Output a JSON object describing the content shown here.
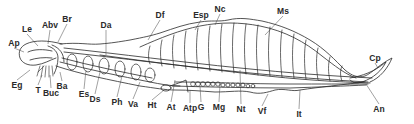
{
  "figure": {
    "line_color": "#2a2a2a",
    "background": "#ffffff",
    "labels": [
      {
        "id": "Ap",
        "text": "Ap",
        "x": 14,
        "y": 43,
        "tx": 24,
        "ty": 52
      },
      {
        "id": "Le",
        "text": "Le",
        "x": 27,
        "y": 29,
        "tx": 38,
        "ty": 46
      },
      {
        "id": "Abv",
        "text": "Abv",
        "x": 50,
        "y": 25,
        "tx": 48,
        "ty": 44
      },
      {
        "id": "Br",
        "text": "Br",
        "x": 67,
        "y": 19,
        "tx": 58,
        "ty": 42
      },
      {
        "id": "Da",
        "text": "Da",
        "x": 106,
        "y": 25,
        "tx": 106,
        "ty": 55
      },
      {
        "id": "Df",
        "text": "Df",
        "x": 160,
        "y": 15,
        "tx": 148,
        "ty": 40
      },
      {
        "id": "Esp",
        "text": "Esp",
        "x": 201,
        "y": 15,
        "tx": 195,
        "ty": 30
      },
      {
        "id": "Nc",
        "text": "Nc",
        "x": 220,
        "y": 9,
        "tx": 215,
        "ty": 25
      },
      {
        "id": "Ms",
        "text": "Ms",
        "x": 283,
        "y": 11,
        "tx": 265,
        "ty": 35
      },
      {
        "id": "Cp",
        "text": "Cp",
        "x": 375,
        "y": 58,
        "tx": 378,
        "ty": 68
      },
      {
        "id": "An",
        "text": "An",
        "x": 379,
        "y": 109,
        "tx": 366,
        "ty": 84
      },
      {
        "id": "Eg",
        "text": "Eg",
        "x": 17,
        "y": 85,
        "tx": 30,
        "ty": 70
      },
      {
        "id": "T",
        "text": "T",
        "x": 38,
        "y": 90,
        "tx": 42,
        "ty": 75
      },
      {
        "id": "Buc",
        "text": "Buc",
        "x": 51,
        "y": 93,
        "tx": 50,
        "ty": 75
      },
      {
        "id": "Ba",
        "text": "Ba",
        "x": 62,
        "y": 86,
        "tx": 60,
        "ty": 72
      },
      {
        "id": "Es",
        "text": "Es",
        "x": 84,
        "y": 94,
        "tx": 86,
        "ty": 70
      },
      {
        "id": "Ds",
        "text": "Ds",
        "x": 95,
        "y": 99,
        "tx": 100,
        "ty": 72
      },
      {
        "id": "Ph",
        "text": "Ph",
        "x": 117,
        "y": 102,
        "tx": 122,
        "ty": 76
      },
      {
        "id": "Va",
        "text": "Va",
        "x": 133,
        "y": 104,
        "tx": 140,
        "ty": 82
      },
      {
        "id": "Ht",
        "text": "Ht",
        "x": 152,
        "y": 105,
        "tx": 164,
        "ty": 90
      },
      {
        "id": "At",
        "text": "At",
        "x": 171,
        "y": 107,
        "tx": 175,
        "ty": 80
      },
      {
        "id": "Atp",
        "text": "Atp",
        "x": 190,
        "y": 108,
        "tx": 190,
        "ty": 90
      },
      {
        "id": "G",
        "text": "G",
        "x": 201,
        "y": 107,
        "tx": 200,
        "ty": 86
      },
      {
        "id": "Mg",
        "text": "Mg",
        "x": 219,
        "y": 107,
        "tx": 220,
        "ty": 84
      },
      {
        "id": "Nt",
        "text": "Nt",
        "x": 241,
        "y": 109,
        "tx": 240,
        "ty": 70
      },
      {
        "id": "Vf",
        "text": "Vf",
        "x": 262,
        "y": 111,
        "tx": 268,
        "ty": 94
      },
      {
        "id": "It",
        "text": "It",
        "x": 299,
        "y": 114,
        "tx": 300,
        "ty": 90
      }
    ]
  }
}
